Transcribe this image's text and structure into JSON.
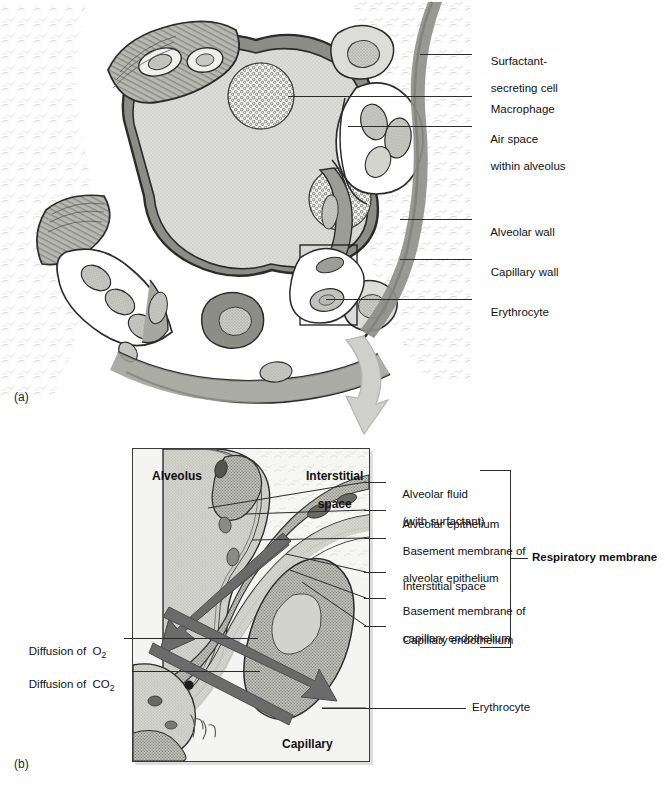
{
  "figure": {
    "panel_a": {
      "tag": "(a)",
      "labels": [
        {
          "id": "surfactant",
          "text_line1": "Surfactant-",
          "text_line2": "secreting cell"
        },
        {
          "id": "macrophage",
          "text_line1": "Macrophage",
          "text_line2": ""
        },
        {
          "id": "airspace",
          "text_line1": "Air space",
          "text_line2": "within alveolus"
        },
        {
          "id": "alveolar-wall",
          "text_line1": "Alveolar wall",
          "text_line2": ""
        },
        {
          "id": "capillary-wall",
          "text_line1": "Capillary wall",
          "text_line2": ""
        },
        {
          "id": "erythrocyte",
          "text_line1": "Erythrocyte",
          "text_line2": ""
        }
      ]
    },
    "panel_b": {
      "tag": "(b)",
      "inset_labels": {
        "alveolus": "Alveolus",
        "interstitial_line1": "Interstitial",
        "interstitial_line2": "space",
        "capillary": "Capillary"
      },
      "diffusion": {
        "o2_prefix": "Diffusion of  O",
        "o2_sub": "2",
        "co2_prefix": "Diffusion of  CO",
        "co2_sub": "2"
      },
      "erythrocyte_label": "Erythrocyte",
      "membrane_layers": [
        {
          "line1": "Alveolar fluid",
          "line2": "(with surfactant)"
        },
        {
          "line1": "Alveolar epithelium",
          "line2": ""
        },
        {
          "line1": "Basement membrane of",
          "line2": "alveolar epithelium"
        },
        {
          "line1": "Interstitial space",
          "line2": ""
        },
        {
          "line1": "Basement membrane of",
          "line2": "capillary endothelium"
        },
        {
          "line1": "Capillary endothelium",
          "line2": ""
        }
      ],
      "bracket_label": "Respiratory membrane"
    }
  },
  "colors": {
    "ink": "#2b2b2b",
    "arrow_gray": "#6b6b6b",
    "panel_bg": "#f4f4f2",
    "tissue_light": "#d8d8d4",
    "tissue_mid": "#a9a9a4",
    "tissue_dark": "#6f6f6b",
    "callout_arrow": "#c9c9c6"
  }
}
